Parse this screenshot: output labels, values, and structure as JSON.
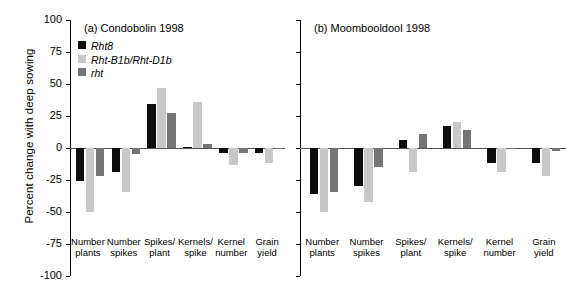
{
  "chart_data": {
    "type": "bar",
    "title": "",
    "xlabel": "",
    "ylabel": "Percent change with deep sowing",
    "ylim": [
      -100,
      100
    ],
    "yticks": [
      100,
      75,
      50,
      25,
      0,
      -25,
      -50,
      -75,
      -100
    ],
    "ytick_labels": [
      "100",
      "75",
      "50",
      "25",
      "0",
      "-25",
      "-50",
      "-75",
      "-100"
    ],
    "grid": false,
    "legend_position": "upper-left-inside-panel-a",
    "categories": [
      "Number plants",
      "Number spikes",
      "Spikes/ plant",
      "Kernels/ spike",
      "Kernel number",
      "Grain yield"
    ],
    "category_lines": [
      [
        "Number",
        "plants"
      ],
      [
        "Number",
        "spikes"
      ],
      [
        "Spikes/",
        "plant"
      ],
      [
        "Kernels/",
        "spike"
      ],
      [
        "Kernel",
        "number"
      ],
      [
        "Grain",
        "yield"
      ]
    ],
    "series_names": [
      "Rht8",
      "Rht-B1b/Rht-D1b",
      "rht"
    ],
    "series_colors": [
      "#0d0d0d",
      "#c8c8c8",
      "#757575"
    ],
    "panels": [
      {
        "id": "a",
        "title": "(a) Condobolin 1998",
        "series": [
          {
            "name": "Rht8",
            "color": "#0d0d0d",
            "values": [
              -26,
              -19,
              34,
              1,
              -4,
              -4
            ]
          },
          {
            "name": "Rht-B1b/Rht-D1b",
            "color": "#c8c8c8",
            "values": [
              -50,
              -34,
              47,
              36,
              -13,
              -12
            ]
          },
          {
            "name": "rht",
            "color": "#757575",
            "values": [
              -22,
              -5,
              27,
              3,
              -4,
              -1
            ]
          }
        ]
      },
      {
        "id": "b",
        "title": "(b) Moombooldool 1998",
        "series": [
          {
            "name": "Rht8",
            "color": "#0d0d0d",
            "values": [
              -36,
              -30,
              6,
              17,
              -12,
              -12
            ]
          },
          {
            "name": "Rht-B1b/Rht-D1b",
            "color": "#c8c8c8",
            "values": [
              -50,
              -42,
              -19,
              20,
              -19,
              -22
            ]
          },
          {
            "name": "rht",
            "color": "#757575",
            "values": [
              -34,
              -15,
              11,
              14,
              -1,
              -2
            ]
          }
        ]
      }
    ]
  },
  "legend": {
    "items": [
      {
        "label": "Rht8",
        "swatch": "black"
      },
      {
        "label": "Rht-B1b/Rht-D1b",
        "swatch": "light"
      },
      {
        "label": "rht",
        "swatch": "dark"
      }
    ]
  }
}
